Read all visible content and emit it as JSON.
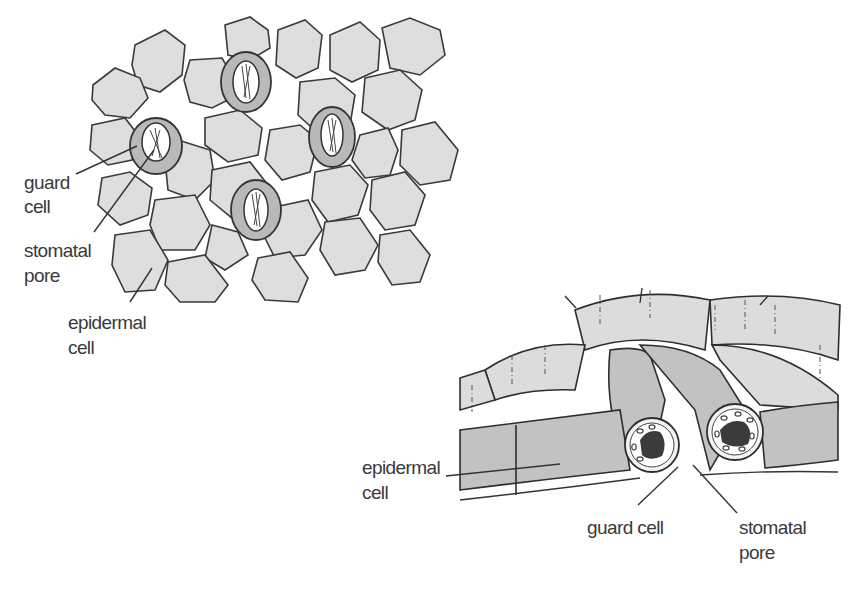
{
  "figure": {
    "surface_view": {
      "description": "Surface view of epidermis showing stomata among epidermal cells",
      "labels": {
        "guard_cell_line1": "guard",
        "guard_cell_line2": "cell",
        "stomatal_pore_line1": "stomatal",
        "stomatal_pore_line2": "pore",
        "epidermal_cell_line1": "epidermal",
        "epidermal_cell_line2": "cell"
      },
      "stomata_count": 4
    },
    "section_view": {
      "description": "3D cross-section through a stoma",
      "labels": {
        "epidermal_cell_line1": "epidermal",
        "epidermal_cell_line2": "cell",
        "guard_cell": "guard cell",
        "stomatal_pore_line1": "stomatal",
        "stomatal_pore_line2": "pore"
      }
    },
    "colors": {
      "cell_fill": "#dedede",
      "guard_fill": "#b9b9b9",
      "outline": "#3a3a3a",
      "nucleus": "#3b3b3b",
      "background": "#ffffff"
    }
  }
}
